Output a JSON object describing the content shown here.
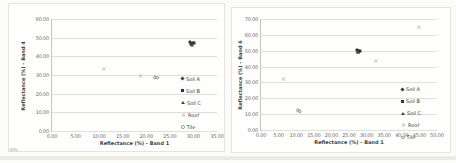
{
  "figure": {
    "background": "#fbfbf8",
    "panel_border": "#e3e3df",
    "grid_color": "#e0dfdc",
    "axis_line_color": "#c6c5c1",
    "tick_text_color": "#6b6b68",
    "title_text_color": "#44443f"
  },
  "chart_data": [
    {
      "type": "scatter",
      "title": "",
      "xlabel": "Reflectance (%) - Band 1",
      "ylabel": "Reflectance (%) - Band 4",
      "xlim": [
        0,
        35
      ],
      "ylim": [
        0,
        60
      ],
      "xticks": [
        "0.00",
        "5.00",
        "10.00",
        "15.00",
        "20.00",
        "25.00",
        "30.00",
        "35.00"
      ],
      "yticks": [
        "60.00",
        "50.00",
        "40.00",
        "30.00",
        "20.00",
        "10.00",
        "0.00"
      ],
      "grid": "horizontal",
      "legend_position": "inside-right",
      "legend_top_pct": 48,
      "ylabel_offset": 14,
      "plot": {
        "left": 42,
        "top": 15,
        "width": 166,
        "height": 113
      },
      "series": [
        {
          "name": "Soil A",
          "marker": "diamond",
          "color": "#3c3c3a",
          "points": [
            [
              29.3,
              47.6
            ],
            [
              29.9,
              47.3
            ]
          ]
        },
        {
          "name": "Soil B",
          "marker": "square",
          "color": "#343432",
          "points": [
            [
              30.1,
              46.9
            ],
            [
              29.5,
              46.6
            ]
          ]
        },
        {
          "name": "Soil C",
          "marker": "triangle",
          "color": "#454543",
          "points": [
            [
              29.7,
              46.2
            ]
          ]
        },
        {
          "name": "Roof",
          "marker": "x",
          "color": "#bbbbb7",
          "points": [
            [
              11.0,
              33.1
            ],
            [
              18.8,
              29.7
            ]
          ]
        },
        {
          "name": "Tile",
          "marker": "circle",
          "color": "#8e8e8b",
          "points": [
            [
              21.8,
              28.8
            ],
            [
              22.3,
              28.4
            ]
          ]
        }
      ]
    },
    {
      "type": "scatter",
      "title": "",
      "xlabel": "Reflectance (%) - Band 1",
      "ylabel": "Reflectance (%) - Band 6",
      "xlim": [
        0,
        50
      ],
      "ylim": [
        0,
        70
      ],
      "xticks": [
        "0.00",
        "5.00",
        "10.00",
        "15.00",
        "20.00",
        "25.00",
        "30.00",
        "35.00",
        "40.00",
        "45.00",
        "50.00"
      ],
      "yticks": [
        "70.00",
        "60.00",
        "50.00",
        "40.00",
        "30.00",
        "20.00",
        "10.00",
        "0.00"
      ],
      "grid": "horizontal",
      "legend_position": "inside-right",
      "legend_top_pct": 58,
      "ylabel_offset": 8,
      "plot": {
        "left": 28,
        "top": 11,
        "width": 177,
        "height": 112
      },
      "series": [
        {
          "name": "Soil A",
          "marker": "diamond",
          "color": "#3c3c3a",
          "points": [
            [
              27.2,
              50.3
            ],
            [
              27.8,
              50.0
            ]
          ]
        },
        {
          "name": "Soil B",
          "marker": "square",
          "color": "#343432",
          "points": [
            [
              28.1,
              49.6
            ],
            [
              27.5,
              49.3
            ]
          ]
        },
        {
          "name": "Soil C",
          "marker": "triangle",
          "color": "#454543",
          "points": [
            [
              27.6,
              48.9
            ]
          ]
        },
        {
          "name": "Roof",
          "marker": "x",
          "color": "#bbbbb7",
          "points": [
            [
              6.3,
              32.3
            ],
            [
              32.6,
              43.8
            ],
            [
              44.8,
              65.2
            ]
          ]
        },
        {
          "name": "Tile",
          "marker": "circle",
          "color": "#8e8e8b",
          "points": [
            [
              10.5,
              12.3
            ],
            [
              11.0,
              11.9
            ]
          ]
        }
      ]
    }
  ]
}
